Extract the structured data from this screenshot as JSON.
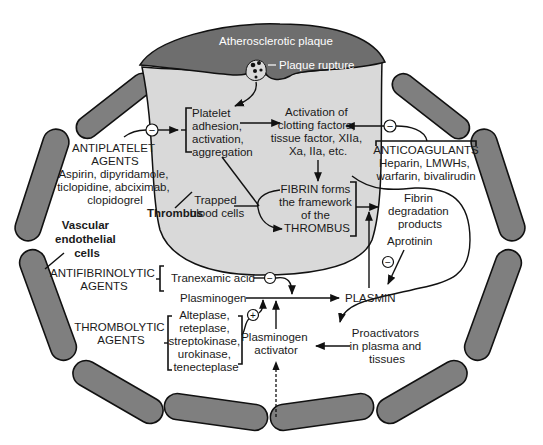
{
  "diagram": {
    "colors": {
      "vessel_cells": "#7f7f7f",
      "plaque": "#6e6e6e",
      "thrombus": "#d9d9d9",
      "lines": "#111111",
      "text": "#1a1a1a"
    },
    "labels": {
      "plaque": "Atherosclerotic plaque",
      "plaque_rupture": "Plaque rupture",
      "platelet": [
        "Platelet",
        "adhesion,",
        "activation,",
        "aggregation"
      ],
      "activation": [
        "Activation of",
        "clotting factors,",
        "tissue factor, XIIa,",
        "Xa, IIa, etc."
      ],
      "fibrin": [
        "FIBRIN forms",
        "the framework",
        "of the",
        "THROMBUS"
      ],
      "trapped": [
        "Trapped",
        "blood cells"
      ],
      "thrombus": "Thrombus",
      "vascular": [
        "Vascular",
        "endothelial",
        "cells"
      ],
      "antiplatelet_title": [
        "ANTIPLATELET",
        "AGENTS"
      ],
      "antiplatelet_drugs": [
        "Aspirin, dipyridamole,",
        "ticlopidine, abciximab,",
        "clopidogrel"
      ],
      "anticoagulants_title": "ANTICOAGULANTS",
      "anticoagulants_drugs": [
        "Heparin, LMWHs,",
        "warfarin, bivalirudin"
      ],
      "fibrin_degradation": [
        "Fibrin",
        "degradation",
        "products"
      ],
      "aprotinin": "Aprotinin",
      "antifibrinolytic_title": [
        "ANTIFIBRINOLYTIC",
        "AGENTS"
      ],
      "tranexamic": "Tranexamic acid",
      "plasminogen": "Plasminogen",
      "plasmin": "PLASMIN",
      "thrombolytic_title": [
        "THROMBOLYTIC",
        "AGENTS"
      ],
      "thrombolytic_drugs": [
        "Alteplase,",
        "reteplase,",
        "streptokinase,",
        "urokinase,",
        "tenecteplase"
      ],
      "plasminogen_activator": [
        "Plasminogen",
        "activator"
      ],
      "proactivators": [
        "Proactivators",
        "in plasma and",
        "tissues"
      ]
    },
    "symbols": {
      "inhibit": "−",
      "stimulate": "+"
    }
  }
}
